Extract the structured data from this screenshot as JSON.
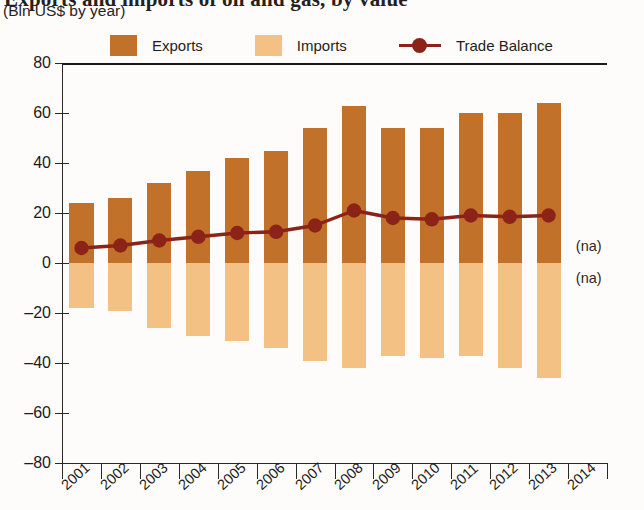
{
  "title": {
    "main": "Exports and imports of oil and gas, by value",
    "sub": "(Bln US$ by year)"
  },
  "legend": {
    "exports_label": "Exports",
    "imports_label": "Imports",
    "balance_label": "Trade Balance"
  },
  "colors": {
    "exports": "#c2712a",
    "imports": "#f3c183",
    "balance": "#8c2318",
    "axis": "#2a2724",
    "background": "#fdfcfa"
  },
  "annotations": {
    "na_above": "(na)",
    "na_below": "(na)"
  },
  "chart_data": {
    "type": "bar",
    "title": "Exports and imports of oil and gas, by value",
    "subtitle": "(Bln US$ by year)",
    "xlabel": "",
    "ylabel": "Bln US$",
    "ylim": [
      -80,
      80
    ],
    "yticks": [
      80,
      60,
      40,
      20,
      0,
      -20,
      -40,
      -60,
      -80
    ],
    "ytick_labels": [
      "80",
      "60",
      "40",
      "20",
      "0",
      "–20",
      "–40",
      "–60",
      "–80"
    ],
    "grid": false,
    "legend_position": "top",
    "categories": [
      "2001",
      "2002",
      "2003",
      "2004",
      "2005",
      "2006",
      "2007",
      "2008",
      "2009",
      "2010",
      "2011",
      "2012",
      "2013",
      "2014"
    ],
    "series": [
      {
        "name": "Exports",
        "type": "bar",
        "color": "#c2712a",
        "values": [
          24,
          26,
          32,
          37,
          42,
          45,
          54,
          63,
          54,
          54,
          60,
          60,
          64,
          null
        ]
      },
      {
        "name": "Imports",
        "type": "bar",
        "color": "#f3c183",
        "values": [
          -18,
          -19,
          -26,
          -29,
          -31,
          -34,
          -39,
          -42,
          -37,
          -38,
          -37,
          -42,
          -46,
          null
        ]
      },
      {
        "name": "Trade Balance",
        "type": "line",
        "color": "#8c2318",
        "values": [
          6,
          7,
          9,
          10.5,
          12,
          12.5,
          15,
          21,
          18,
          17.5,
          19,
          18.5,
          19,
          null
        ]
      }
    ],
    "notes": [
      "2014 values not available (na)"
    ]
  }
}
